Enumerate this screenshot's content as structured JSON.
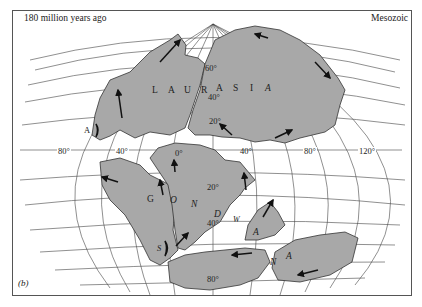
{
  "figure": {
    "time_label": "180 million years ago",
    "era_label": "Mesozoic",
    "panel_label": "(b)"
  },
  "continents": {
    "laurasia": {
      "name": "LAURASIA",
      "letters": [
        "L",
        "A",
        "U",
        "R",
        "A",
        "S",
        "I",
        "A"
      ]
    },
    "gondwana": {
      "name": "GONDWANA",
      "letters": [
        "G",
        "O",
        "N",
        "D",
        "W",
        "A",
        "N",
        "A"
      ]
    }
  },
  "markers": {
    "a_label": "A",
    "s_label": "S"
  },
  "longitude_labels": [
    "80°",
    "40°",
    "0°",
    "40°",
    "80°",
    "120°"
  ],
  "latitude_labels": {
    "laurasia": [
      "60°",
      "40°",
      "20°"
    ],
    "gondwana": [
      "20°",
      "40°",
      "80°"
    ]
  },
  "colors": {
    "land": "#a8a8a8",
    "ocean": "#ffffff",
    "grid": "#444444",
    "arrows": "#111111"
  }
}
